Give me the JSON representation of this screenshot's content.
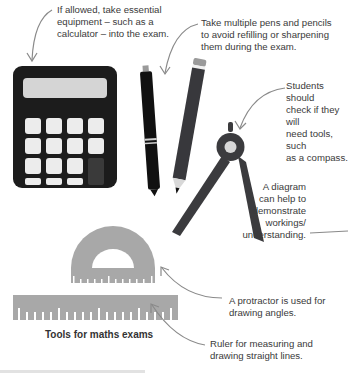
{
  "notes": {
    "calculator": [
      "If allowed, take essential",
      "equipment – such as a",
      "calculator – into the exam."
    ],
    "pens": [
      "Take multiple pens and pencils",
      "to avoid refilling or sharpening",
      "them during the exam."
    ],
    "compass": [
      "Students should",
      "check if they will",
      "need tools, such",
      "as a compass."
    ],
    "diagram": [
      "A diagram",
      "can help to",
      "demonstrate",
      "workings/",
      "understanding."
    ],
    "protractor": [
      "A protractor is used for",
      "drawing angles."
    ],
    "ruler": [
      "Ruler for measuring and",
      "drawing straight lines."
    ]
  },
  "caption": "Tools for maths exams",
  "colors": {
    "dark": "#1c1c1c",
    "compass": "#3b3b3e",
    "pencil": "#38383c",
    "grey_tool": "#a8a8a8",
    "screen": "#d5d5d5",
    "key": "#ececec",
    "arrow": "#8a8a8a"
  }
}
